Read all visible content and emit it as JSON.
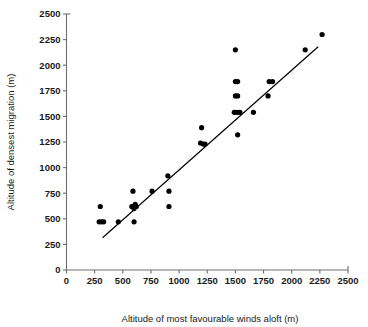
{
  "chart_data": {
    "type": "scatter",
    "title": "",
    "xlabel": "Altitude of most favourable winds aloft (m)",
    "ylabel": "Altitude of densest migration (m)",
    "xlim": [
      0,
      2500
    ],
    "ylim": [
      0,
      2500
    ],
    "xticks": [
      0,
      250,
      500,
      750,
      1000,
      1250,
      1500,
      1750,
      2000,
      2250,
      2500
    ],
    "yticks": [
      0,
      250,
      500,
      750,
      1000,
      1250,
      1500,
      1750,
      2000,
      2250,
      2500
    ],
    "xtick_labels": [
      "0",
      "250",
      "500",
      "750",
      "1000",
      "1250",
      "1500",
      "1750",
      "2000",
      "2250",
      "2500"
    ],
    "ytick_labels": [
      "0",
      "250",
      "500",
      "750",
      "1000",
      "1250",
      "1500",
      "1750",
      "2000",
      "2250",
      "2500"
    ],
    "grid": false,
    "legend": null,
    "marker": "filled-circle",
    "marker_color": "#000000",
    "points": [
      {
        "x": 300,
        "y": 620
      },
      {
        "x": 290,
        "y": 470
      },
      {
        "x": 310,
        "y": 470
      },
      {
        "x": 330,
        "y": 470
      },
      {
        "x": 460,
        "y": 470
      },
      {
        "x": 590,
        "y": 770
      },
      {
        "x": 580,
        "y": 620
      },
      {
        "x": 600,
        "y": 620
      },
      {
        "x": 620,
        "y": 620
      },
      {
        "x": 600,
        "y": 600
      },
      {
        "x": 610,
        "y": 640
      },
      {
        "x": 600,
        "y": 470
      },
      {
        "x": 760,
        "y": 770
      },
      {
        "x": 900,
        "y": 920
      },
      {
        "x": 910,
        "y": 770
      },
      {
        "x": 910,
        "y": 620
      },
      {
        "x": 1200,
        "y": 1390
      },
      {
        "x": 1190,
        "y": 1240
      },
      {
        "x": 1215,
        "y": 1230
      },
      {
        "x": 1230,
        "y": 1230
      },
      {
        "x": 1500,
        "y": 2150
      },
      {
        "x": 1500,
        "y": 1840
      },
      {
        "x": 1520,
        "y": 1840
      },
      {
        "x": 1500,
        "y": 1700
      },
      {
        "x": 1520,
        "y": 1700
      },
      {
        "x": 1490,
        "y": 1540
      },
      {
        "x": 1515,
        "y": 1540
      },
      {
        "x": 1540,
        "y": 1540
      },
      {
        "x": 1520,
        "y": 1320
      },
      {
        "x": 1660,
        "y": 1540
      },
      {
        "x": 1800,
        "y": 1840
      },
      {
        "x": 1830,
        "y": 1840
      },
      {
        "x": 1790,
        "y": 1700
      },
      {
        "x": 2120,
        "y": 2150
      },
      {
        "x": 2270,
        "y": 2300
      }
    ],
    "trend_line": {
      "x_start": 320,
      "y_start": 315,
      "x_end": 2235,
      "y_end": 2180
    }
  }
}
